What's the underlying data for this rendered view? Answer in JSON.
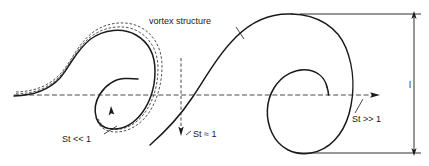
{
  "figure": {
    "background_color": "#ffffff",
    "stroke_color": "#1a1a1a",
    "dash_color": "#333333",
    "labels": {
      "vortex_structure": "vortex structure",
      "stokes_small": "St << 1",
      "stokes_unity": "St ≈ 1",
      "stokes_large": "St >> 1",
      "length_scale": "l"
    },
    "annotations": {
      "vortex_structure_leader": "leader line from text down-right to vortex crest",
      "stokes_small_leader": "leader line from text up-right to dashed particle path",
      "stokes_unity_leader": "vertical dashed line with downward arrowhead",
      "stokes_large_leader": "short leader line up to centerline arrow",
      "length_scale_marker": "vertical double-headed dimension arrow at right edge"
    },
    "elements": {
      "centerline": "horizontal dashed axis with right-pointing arrow",
      "top_boundary": "horizontal solid line tangent to right vortex crest",
      "bottom_boundary": "horizontal solid line tangent to right vortex base",
      "left_vortex": "small rolled-up spiral with dashed particle trajectories",
      "right_vortex": "large rolled-up spiral, solid only",
      "rotation_arrow": "small upward arrowhead on left spiral indicating rotation"
    }
  }
}
